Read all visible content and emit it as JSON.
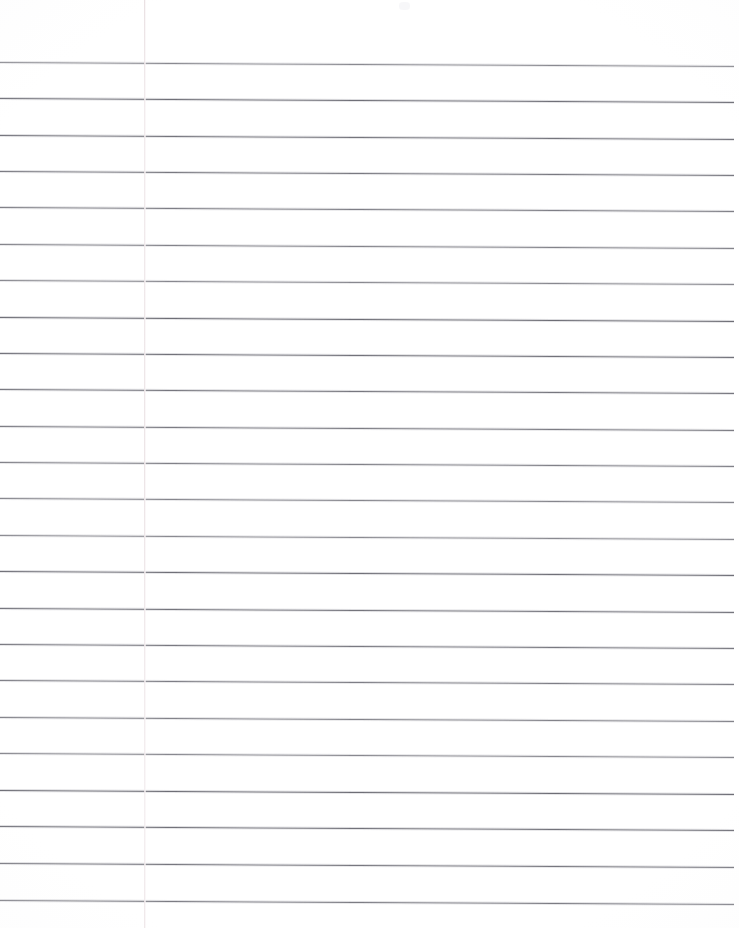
{
  "document": {
    "kind": "scanned-lined-paper",
    "title": "Blank ruled notebook page",
    "page_width": 739,
    "page_height": 928,
    "background_color": "#ffffff",
    "visible_text": "",
    "annotations": []
  },
  "ruling": {
    "type": "wide-ruled horizontal lines",
    "line_color": "#6e6e76",
    "line_count": 24,
    "first_line_y": 62,
    "line_spacing": 36.4,
    "line_thickness": 1,
    "line_start_x": 0,
    "line_end_x": 734,
    "skew_drop_px": 4,
    "line_y_positions": [
      62,
      98,
      135,
      171,
      207,
      244,
      280,
      317,
      353,
      389,
      426,
      462,
      498,
      535,
      571,
      608,
      644,
      680,
      717,
      753,
      790,
      826,
      863,
      900
    ]
  },
  "margin_rule": {
    "present": true,
    "orientation": "vertical",
    "x": 144,
    "color": "#ece4e6",
    "spans_full_height": true
  },
  "artifacts": {
    "smudges": [
      {
        "x": 399,
        "y": 2,
        "w": 11,
        "h": 8
      }
    ],
    "edge_shading": "faint vignette at page borders"
  }
}
